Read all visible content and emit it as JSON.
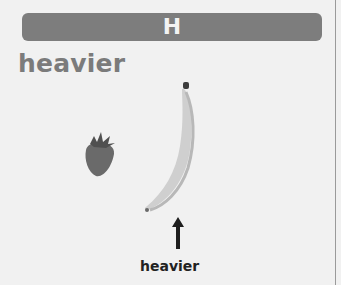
{
  "card": {
    "letter": "H",
    "word": "heavier",
    "label": "heavier"
  },
  "icons": {
    "light_item": "strawberry-icon",
    "heavy_item": "banana-icon",
    "pointer": "arrow-up-icon"
  },
  "colors": {
    "banner": "#7d7d7d",
    "word": "#7b7b7b",
    "label": "#222222"
  }
}
